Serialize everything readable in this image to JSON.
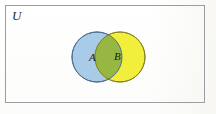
{
  "figure": {
    "kind": "venn-diagram",
    "background_color": "#fdfdfd"
  },
  "universe": {
    "label": "U",
    "border_color": "#9a9ea3",
    "fill_color": "transparent",
    "rect": {
      "x": 5,
      "y": 5,
      "width": 200,
      "height": 98
    }
  },
  "sets": [
    {
      "label": "A",
      "fill_color": "#a8cbe8",
      "stroke_color": "#4f6f93",
      "center": {
        "x": 97,
        "y": 57
      },
      "radius": 25
    },
    {
      "label": "B",
      "fill_color": "#f2ee3c",
      "stroke_color": "#8a8422",
      "center": {
        "x": 120,
        "y": 57
      },
      "radius": 25
    }
  ],
  "intersection": {
    "label": "",
    "fill_color": "#96b843",
    "description": "A intersect B"
  },
  "labels": {
    "universe": "U",
    "set_a": "A",
    "set_b": "B"
  }
}
